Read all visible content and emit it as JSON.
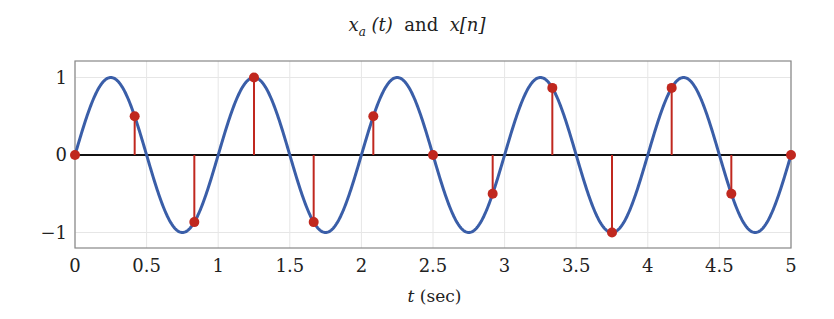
{
  "chart_data": {
    "type": "line",
    "title_parts": {
      "sig_a": "x",
      "sig_a_sub": "a",
      "sig_a_arg": "(t)",
      "and": "and",
      "sig_n": "x[n]"
    },
    "xlabel": "t (sec)",
    "xlabel_parts": {
      "var": "t",
      "unit": "(sec)"
    },
    "ylabel": "",
    "xlim": [
      0,
      5
    ],
    "ylim": [
      -1.2,
      1.2
    ],
    "x_ticks": [
      "0",
      "0.5",
      "1",
      "1.5",
      "2",
      "2.5",
      "3",
      "3.5",
      "4",
      "4.5",
      "5"
    ],
    "y_ticks": [
      "1",
      "0",
      "−1"
    ],
    "grid": true,
    "series": [
      {
        "name": "x_a(t)",
        "kind": "continuous",
        "function": "sin(2*pi*t)",
        "color": "#3a5ea8"
      },
      {
        "name": "x[n]",
        "kind": "stem",
        "color": "#c0281f",
        "t": [
          0,
          0.4167,
          0.8333,
          1.25,
          1.6667,
          2.0833,
          2.5,
          2.9167,
          3.3333,
          3.75,
          4.1667,
          4.5833,
          5.0
        ],
        "values": [
          0,
          0.5,
          -0.866,
          1,
          -0.866,
          0.5,
          0,
          -0.5,
          0.866,
          -1,
          0.866,
          -0.5,
          0
        ]
      }
    ]
  },
  "colors": {
    "curve": "#3a5ea8",
    "stem": "#c0281f",
    "zero_line": "#111111",
    "frame": "#888888",
    "grid": "#e6e6e6"
  }
}
